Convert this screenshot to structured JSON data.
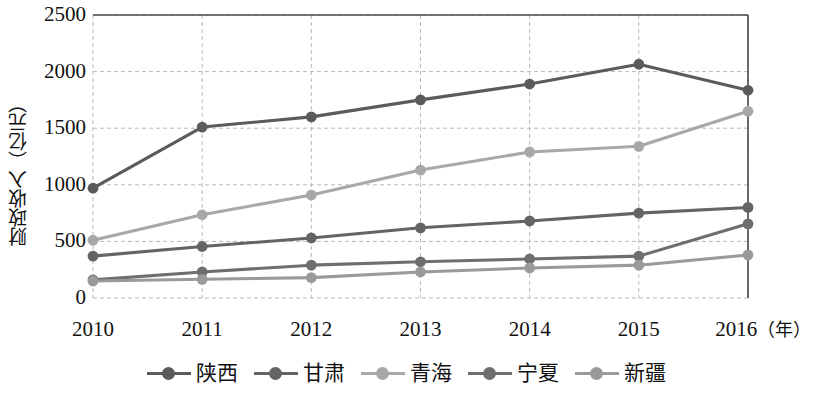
{
  "chart_data": {
    "type": "line",
    "title": "",
    "xlabel": "年",
    "ylabel": "财政收入（亿元）",
    "x": [
      2010,
      2011,
      2012,
      2013,
      2014,
      2015,
      2016
    ],
    "xticklabels": [
      "2010",
      "2011",
      "2012",
      "2013",
      "2014",
      "2015",
      "2016"
    ],
    "x_unit_label": "（年）",
    "yticklabels": [
      "0",
      "500",
      "1000",
      "1500",
      "2000",
      "2500"
    ],
    "yticks": [
      0,
      500,
      1000,
      1500,
      2000,
      2500
    ],
    "ylim": [
      0,
      2500
    ],
    "grid": true,
    "legend_position": "bottom",
    "series": [
      {
        "name": "陕西",
        "color": "#5b5b5b",
        "values": [
          970,
          1510,
          1600,
          1750,
          1890,
          2065,
          1835
        ]
      },
      {
        "name": "甘肃",
        "color": "#646464",
        "values": [
          370,
          455,
          530,
          620,
          680,
          750,
          800
        ]
      },
      {
        "name": "青海",
        "color": "#a8a8a8",
        "values": [
          510,
          735,
          910,
          1130,
          1290,
          1340,
          1650
        ]
      },
      {
        "name": "宁夏",
        "color": "#6e6e6e",
        "values": [
          160,
          230,
          290,
          320,
          345,
          370,
          655
        ]
      },
      {
        "name": "新疆",
        "color": "#9a9a9a",
        "values": [
          150,
          165,
          180,
          230,
          265,
          290,
          380
        ]
      }
    ]
  },
  "axis": {
    "frame_color": "#4a4a4a",
    "grid_color": "#b9b9b9"
  }
}
